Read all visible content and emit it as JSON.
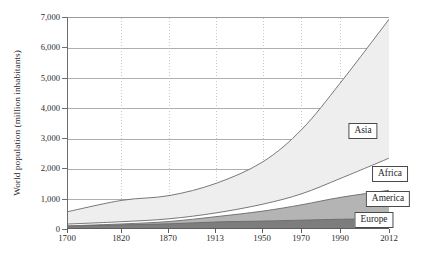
{
  "chart_data": {
    "type": "area",
    "stacked": true,
    "title": "",
    "subtitle": "",
    "xlabel": "",
    "ylabel": "World population (million inhabitants)",
    "categories": [
      "1700",
      "1820",
      "1870",
      "1913",
      "1950",
      "1970",
      "1990",
      "2012"
    ],
    "x_tick_labels": [
      "1700",
      "1820",
      "1870",
      "1913",
      "1950",
      "1970",
      "1990",
      "2012"
    ],
    "y_tick_labels": [
      "0",
      "1,000",
      "2,000",
      "3,000",
      "4,000",
      "5,000",
      "6,000",
      "7,000"
    ],
    "y_tick_values": [
      0,
      1000,
      2000,
      3000,
      4000,
      5000,
      6000,
      7000
    ],
    "ylim": [
      0,
      7000
    ],
    "grid": {
      "horizontal": "solid",
      "vertical": "dotted"
    },
    "legend_position": "inline-labels",
    "series": [
      {
        "name": "Europe",
        "color": "#7d7d7d",
        "values": [
          125,
          170,
          205,
          265,
          295,
          325,
          355,
          370
        ],
        "label": "Europe"
      },
      {
        "name": "America",
        "color": "#b4b4b4",
        "values": [
          12,
          30,
          75,
          175,
          330,
          510,
          725,
          945
        ],
        "label": "America"
      },
      {
        "name": "Africa",
        "color": "#ffffff",
        "values": [
          60,
          75,
          90,
          125,
          230,
          365,
          630,
          1070
        ],
        "label": "Africa"
      },
      {
        "name": "Asia",
        "color": "#eeeeee",
        "values": [
          410,
          705,
          765,
          975,
          1400,
          2130,
          3175,
          4615
        ],
        "label": "Asia"
      }
    ],
    "totals": [
      607,
      980,
      1135,
      1540,
      2255,
      3330,
      4885,
      7000
    ],
    "label_positions": [
      {
        "name": "Asia",
        "x": 363,
        "y": 131
      },
      {
        "name": "Africa",
        "x": 390,
        "y": 174
      },
      {
        "name": "America",
        "x": 388,
        "y": 199
      },
      {
        "name": "Europe",
        "x": 374,
        "y": 220
      }
    ]
  },
  "colors": {
    "europe": "#7d7d7d",
    "america": "#b4b4b4",
    "africa": "#ffffff",
    "asia": "#eeeeee",
    "axis": "#5d5d5d",
    "grid": "#9a9a9a",
    "line": "#6a6a6a"
  }
}
